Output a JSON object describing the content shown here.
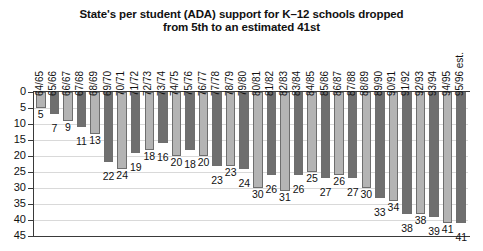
{
  "chart_data": {
    "type": "bar",
    "title": "State's per student (ADA) support for K–12 schools dropped from 5th to an estimated 41st",
    "title_lines": [
      "State's per student (ADA) support for K–12 schools dropped",
      "from 5th to an estimated 41st"
    ],
    "xlabel": "",
    "ylabel": "",
    "ylim": [
      0,
      45
    ],
    "y_inverted": true,
    "grid": true,
    "legend": false,
    "ytick_labels": [
      "0",
      "5",
      "10",
      "15",
      "20",
      "25",
      "30",
      "35",
      "40",
      "45"
    ],
    "ytick_values": [
      0,
      5,
      10,
      15,
      20,
      25,
      30,
      35,
      40,
      45
    ],
    "categories": [
      "64/65",
      "65/66",
      "66/67",
      "67/68",
      "68/69",
      "69/70",
      "70/71",
      "71/72",
      "72/73",
      "73/74",
      "74/75",
      "75/76",
      "76/77",
      "77/78",
      "78/79",
      "79/80",
      "80/81",
      "81/82",
      "82/83",
      "83/84",
      "84/85",
      "85/86",
      "86/87",
      "87/88",
      "88/89",
      "89/90",
      "90/91",
      "91/92",
      "92/93",
      "93/94",
      "94/95",
      "95/96 est."
    ],
    "values": [
      5,
      7,
      9,
      11,
      13,
      22,
      24,
      19,
      18,
      16,
      20,
      18,
      20,
      23,
      23,
      24,
      30,
      26,
      31,
      26,
      25,
      27,
      26,
      27,
      30,
      33,
      34,
      38,
      38,
      39,
      41,
      41
    ],
    "value_labels": [
      "5",
      "7",
      "9",
      "11",
      "13",
      "22",
      "24",
      "19",
      "18",
      "16",
      "20",
      "18",
      "20",
      "23",
      "23",
      "24",
      "30",
      "26",
      "31",
      "26",
      "25",
      "27",
      "26",
      "27",
      "30",
      "33",
      "34",
      "38",
      "38",
      "39",
      "41",
      "41"
    ],
    "bar_colors": [
      "light",
      "dark",
      "light",
      "dark",
      "light",
      "dark",
      "light",
      "dark",
      "light",
      "dark",
      "light",
      "dark",
      "light",
      "dark",
      "light",
      "dark",
      "light",
      "dark",
      "light",
      "dark",
      "light",
      "dark",
      "light",
      "dark",
      "light",
      "dark",
      "light",
      "dark",
      "light",
      "dark",
      "light",
      "dark"
    ],
    "colors": {
      "light": "#b4b4b4",
      "dark": "#6f6f6f",
      "bar_border": "#6e6e6e",
      "grid": "#d9d9d9",
      "axis": "#3a3a3a",
      "text": "#111111",
      "background": "#ffffff"
    }
  }
}
